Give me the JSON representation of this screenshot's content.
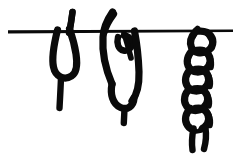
{
  "figure": {
    "title": "Chain sinnet tied on a horizontal bar",
    "description": "Line drawing showing three stages of forming a chain sinnet (daisy chain) from a rope passed over a horizontal bar.",
    "background_color": "#ffffff",
    "ink_color": "#0a0a0a",
    "canvas": {
      "width": 237,
      "height": 157
    }
  },
  "bar": {
    "label": "horizontal bar",
    "x_start": 8,
    "x_end": 233,
    "y": 31,
    "thickness": 3
  },
  "stages": [
    {
      "index": 1,
      "label": "bight over bar",
      "description": "Rope doubled over the bar forming a simple hanging bight with a free tail.",
      "center_x": 63,
      "top_y": 11,
      "bottom_y": 108
    },
    {
      "index": 2,
      "label": "first loop pulled through",
      "description": "A bight is drawn through the standing loop to start the chain.",
      "center_x": 125,
      "top_y": 11,
      "bottom_y": 123
    },
    {
      "index": 3,
      "label": "completed chain sinnet",
      "description": "Successive bights pulled through each other forming a braided chain.",
      "center_x": 199,
      "top_y": 31,
      "bottom_y": 151,
      "link_count": 5
    }
  ]
}
